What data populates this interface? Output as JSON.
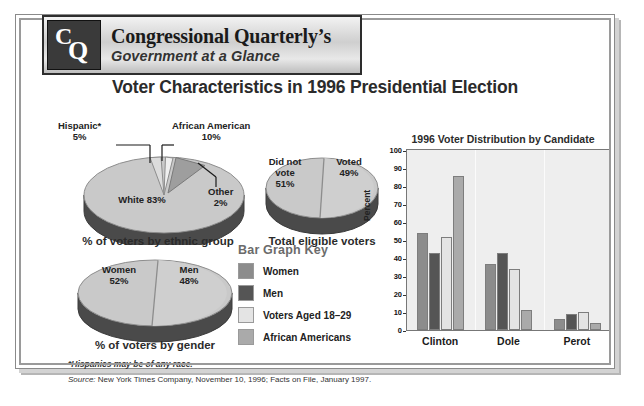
{
  "masthead": {
    "logo_c": "C",
    "logo_q": "Q",
    "line1": "Congressional Quarterly’s",
    "line2": "Government at a Glance"
  },
  "title": "Voter Characteristics in 1996 Presidential Election",
  "pies": [
    {
      "id": "ethnic",
      "caption": "% of voters by ethnic group",
      "labels": [
        {
          "name": "Hispanic*",
          "value": "5%"
        },
        {
          "name": "African American",
          "value": "10%"
        },
        {
          "name": "Other",
          "value": "2%"
        },
        {
          "name": "White 83%",
          "value": ""
        }
      ],
      "slices": [
        {
          "label": "White",
          "pct": 83
        },
        {
          "label": "African American",
          "pct": 10
        },
        {
          "label": "Hispanic",
          "pct": 5
        },
        {
          "label": "Other",
          "pct": 2
        }
      ]
    },
    {
      "id": "eligible",
      "caption": "Total eligible voters",
      "labels": [
        {
          "name": "Did not vote",
          "value": "51%"
        },
        {
          "name": "Voted",
          "value": "49%"
        }
      ],
      "slices": [
        {
          "label": "Did not vote",
          "pct": 51
        },
        {
          "label": "Voted",
          "pct": 49
        }
      ]
    },
    {
      "id": "gender",
      "caption": "% of voters by gender",
      "labels": [
        {
          "name": "Women",
          "value": "52%"
        },
        {
          "name": "Men",
          "value": "48%"
        }
      ],
      "slices": [
        {
          "label": "Women",
          "pct": 52
        },
        {
          "label": "Men",
          "pct": 48
        }
      ]
    }
  ],
  "pie_text": {
    "ethnic_white": "White 83%",
    "ethnic_hispanic_name": "Hispanic*",
    "ethnic_hispanic_val": "5%",
    "ethnic_african_name": "African American",
    "ethnic_african_val": "10%",
    "ethnic_other_name": "Other",
    "ethnic_other_val": "2%",
    "ethnic_caption": "% of voters by ethnic group",
    "elig_didnot_l1": "Did not",
    "elig_didnot_l2": "vote",
    "elig_didnot_l3": "51%",
    "elig_voted_l1": "Voted",
    "elig_voted_l2": "49%",
    "elig_caption": "Total eligible voters",
    "gender_women_l1": "Women",
    "gender_women_l2": "52%",
    "gender_men_l1": "Men",
    "gender_men_l2": "48%",
    "gender_caption": "% of voters by gender"
  },
  "key": {
    "title": "Bar Graph Key",
    "items": [
      {
        "label": "Women",
        "color": "#8c8c8c"
      },
      {
        "label": "Men",
        "color": "#555555"
      },
      {
        "label": "Voters Aged 18–29",
        "color": "#e4e4e4"
      },
      {
        "label": "African Americans",
        "color": "#aaaaaa"
      }
    ]
  },
  "chart_data": {
    "type": "bar",
    "title": "1996 Voter Distribution by Candidate",
    "xlabel": "",
    "ylabel": "Percent",
    "ylim": [
      0,
      100
    ],
    "ytick_step": 10,
    "yticks": [
      "100",
      "90",
      "80",
      "70",
      "60",
      "50",
      "40",
      "30",
      "20",
      "10",
      "0"
    ],
    "grid": false,
    "legend_position": "external-left",
    "categories": [
      "Clinton",
      "Dole",
      "Perot"
    ],
    "series": [
      {
        "name": "Women",
        "color": "#8c8c8c",
        "values": [
          54,
          37,
          6
        ]
      },
      {
        "name": "Men",
        "color": "#555555",
        "values": [
          43,
          43,
          9
        ]
      },
      {
        "name": "Voters Aged 18–29",
        "color": "#e4e4e4",
        "values": [
          52,
          34,
          10
        ]
      },
      {
        "name": "African Americans",
        "color": "#aaaaaa",
        "values": [
          86,
          11,
          4
        ]
      }
    ]
  },
  "footnotes": {
    "asterisk": "*Hispanics may be of any race.",
    "source_label": "Source:",
    "source_text": " New York Times Company, November 10, 1996; Facts on File, January 1997."
  }
}
